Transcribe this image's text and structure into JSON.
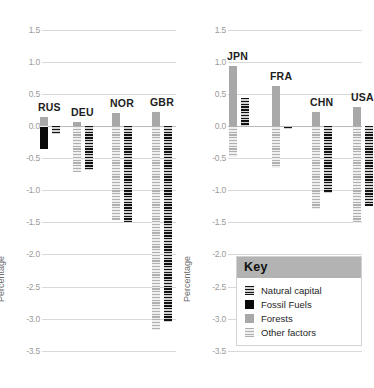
{
  "chart_data": {
    "type": "bar",
    "title": "",
    "xlabel": "",
    "ylabel": "Percentage",
    "ylim": [
      -3.5,
      1.5
    ],
    "ytick_step": 0.5,
    "grid": true,
    "legend_position": "bottom-right",
    "yticks": [
      "1.5",
      "1.0",
      "0.5",
      "0.0",
      "-0.5",
      "-1.0",
      "-1.5",
      "-2.0",
      "-2.5",
      "-3.0",
      "-3.5"
    ],
    "legend_title": "Key",
    "series": [
      {
        "name": "Natural capital",
        "color": "#151515",
        "pattern": "dark-hatch"
      },
      {
        "name": "Fossil Fuels",
        "color": "#0a0a0a",
        "pattern": "solid"
      },
      {
        "name": "Forests",
        "color": "#a8a8a8",
        "pattern": "solid"
      },
      {
        "name": "Other factors",
        "color": "#b0b0b0",
        "pattern": "light-hatch"
      }
    ],
    "panels": [
      {
        "name": "panel-left",
        "categories": [
          "RUS",
          "DEU",
          "NOR",
          "GBR"
        ],
        "groups": [
          {
            "category": "RUS",
            "bars": [
              {
                "series": "Forests",
                "top": 0.14,
                "bottom": 0.0
              },
              {
                "series": "Fossil Fuels",
                "top": 0.0,
                "bottom": -0.36
              },
              {
                "series": "Other factors",
                "top": 0.02,
                "bottom": -0.02
              },
              {
                "series": "Natural capital",
                "top": 0.0,
                "bottom": -0.12
              }
            ]
          },
          {
            "category": "DEU",
            "bars": [
              {
                "series": "Forests",
                "top": 0.06,
                "bottom": 0.0
              },
              {
                "series": "Fossil Fuels",
                "top": 0.0,
                "bottom": -0.55
              },
              {
                "series": "Other factors",
                "top": 0.0,
                "bottom": -0.72
              },
              {
                "series": "Natural capital",
                "top": 0.0,
                "bottom": -0.68
              }
            ]
          },
          {
            "category": "NOR",
            "bars": [
              {
                "series": "Forests",
                "top": 0.2,
                "bottom": 0.0
              },
              {
                "series": "Fossil Fuels",
                "top": 0.0,
                "bottom": -1.16
              },
              {
                "series": "Other factors",
                "top": 0.0,
                "bottom": -1.47
              },
              {
                "series": "Natural capital",
                "top": 0.0,
                "bottom": -1.5
              }
            ]
          },
          {
            "category": "GBR",
            "bars": [
              {
                "series": "Forests",
                "top": 0.22,
                "bottom": 0.0
              },
              {
                "series": "Fossil Fuels",
                "top": 0.0,
                "bottom": -2.8
              },
              {
                "series": "Other factors",
                "top": 0.0,
                "bottom": -3.18
              },
              {
                "series": "Natural capital",
                "top": 0.0,
                "bottom": -3.06
              }
            ]
          }
        ]
      },
      {
        "name": "panel-right",
        "categories": [
          "JPN",
          "FRA",
          "CHN",
          "USA"
        ],
        "groups": [
          {
            "category": "JPN",
            "bars": [
              {
                "series": "Forests",
                "top": 0.93,
                "bottom": 0.0
              },
              {
                "series": "Other factors",
                "top": 0.0,
                "bottom": -0.49
              },
              {
                "series": "Natural capital",
                "top": 0.44,
                "bottom": 0.0
              }
            ]
          },
          {
            "category": "FRA",
            "bars": [
              {
                "series": "Forests",
                "top": 0.62,
                "bottom": 0.0
              },
              {
                "series": "Other factors",
                "top": 0.0,
                "bottom": -0.65
              },
              {
                "series": "Natural capital",
                "top": -0.01,
                "bottom": -0.03
              }
            ]
          },
          {
            "category": "CHN",
            "bars": [
              {
                "series": "Forests",
                "top": 0.22,
                "bottom": 0.0
              },
              {
                "series": "Other factors",
                "top": 0.0,
                "bottom": -1.29
              },
              {
                "series": "Natural capital",
                "top": 0.0,
                "bottom": -1.05
              }
            ]
          },
          {
            "category": "USA",
            "bars": [
              {
                "series": "Forests",
                "top": 0.3,
                "bottom": 0.0
              },
              {
                "series": "Other factors",
                "top": 0.0,
                "bottom": -1.51
              },
              {
                "series": "Natural capital",
                "top": 0.0,
                "bottom": -1.25
              }
            ]
          }
        ]
      }
    ]
  },
  "labels": {
    "RUS": "RUS",
    "DEU": "DEU",
    "NOR": "NOR",
    "GBR": "GBR",
    "JPN": "JPN",
    "FRA": "FRA",
    "CHN": "CHN",
    "USA": "USA"
  }
}
